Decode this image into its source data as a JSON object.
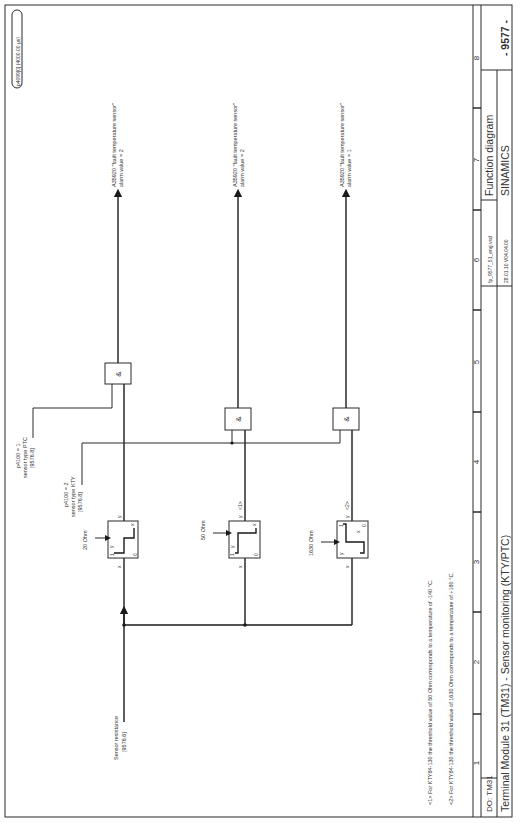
{
  "page": {
    "orientation": "rotated-90-ccw",
    "sampling_badge": "p4099[0] (4000.00 µs)"
  },
  "title_block": {
    "column_numbers": [
      "1",
      "2",
      "3",
      "4",
      "5",
      "6",
      "7",
      "8"
    ],
    "drive_object": "DO: TM31",
    "title": "Terminal Module 31 (TM31) - Sensor monitoring (KTY/PTC)",
    "file": "fp_9577_51_eng.vsd",
    "date_version": "28.01.10  V04.04.00",
    "doc_type": "Function diagram",
    "product": "SINAMICS",
    "page_number": "- 9577 -"
  },
  "inputs": {
    "sensor_resistance": {
      "label": "Sensor resistance",
      "ref": "[9576.6]"
    },
    "ptc_select": {
      "line1": "p4100 = 1",
      "line2": "sensor type PTC",
      "ref": "[9576.8]"
    },
    "kty_select": {
      "line1": "p4100 = 2",
      "line2": "sensor type KTY",
      "ref": "[9576.8]"
    }
  },
  "comparators": [
    {
      "threshold": "20 Ohm",
      "in_label": "x",
      "out_label": "y",
      "note": "",
      "hi": "1",
      "lo": "0",
      "axis_x": "x",
      "axis_y": "y"
    },
    {
      "threshold": "50 Ohm",
      "in_label": "x",
      "out_label": "y",
      "note": "<1>",
      "hi": "1",
      "lo": "0",
      "axis_x": "x",
      "axis_y": "y"
    },
    {
      "threshold": "1630 Ohm",
      "in_label": "x",
      "out_label": "y",
      "note": "<2>",
      "hi": "1",
      "lo": "0",
      "axis_x": "x",
      "axis_y": "y"
    }
  ],
  "and_gates": [
    {
      "symbol": "&"
    },
    {
      "symbol": "&"
    },
    {
      "symbol": "&"
    }
  ],
  "outputs": [
    {
      "line1": "A35920 \"fault temperature sensor\"",
      "line2": "alarm value = 2"
    },
    {
      "line1": "A35920 \"fault temperature sensor\"",
      "line2": "alarm value = 2"
    },
    {
      "line1": "A35920 \"fault temperature sensor\"",
      "line2": "alarm value = 1"
    }
  ],
  "footnotes": [
    "<1> For KTY84-130 the threshold value of 50 Ohm corresponds to a temperature of -140 °C.",
    "<2> For KTY84-130 the threshold value of 1630 Ohm corresponds to a temperature of +180 °C."
  ]
}
